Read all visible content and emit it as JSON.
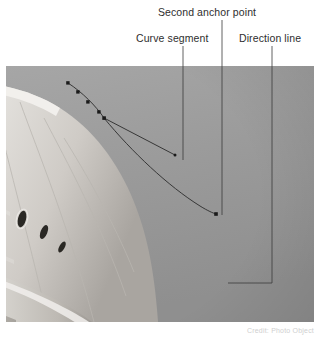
{
  "figure": {
    "kind": "annotated-photograph",
    "background_color": "#ffffff"
  },
  "callouts": [
    {
      "id": "second-anchor-point",
      "label": "Second anchor point",
      "leader_x": 222,
      "leader_y_start": 20,
      "leader_y_end": 215
    },
    {
      "id": "curve-segment",
      "label": "Curve segment",
      "leader_x": 183,
      "leader_y_start": 46,
      "leader_y_end": 160
    },
    {
      "id": "direction-line",
      "label": "Direction line",
      "leader_x": 272,
      "leader_y_start": 46,
      "leader_y_end": 283,
      "elbow_x": 228
    }
  ],
  "photo": {
    "subject": "United States Capitol dome",
    "style": "grayscale photograph",
    "sky_color": "#9b9b9b",
    "dome_color": "#e8e6e2",
    "x": 6,
    "y": 66,
    "width": 308,
    "height": 256
  },
  "path_overlay": {
    "stroke_color": "#2b2b2b",
    "anchor_fill": "#1a1a1a",
    "anchor_points": [
      {
        "x": 68,
        "y": 83
      },
      {
        "x": 78,
        "y": 92
      },
      {
        "x": 88,
        "y": 102
      },
      {
        "x": 99,
        "y": 112
      },
      {
        "x": 104,
        "y": 118
      },
      {
        "x": 216,
        "y": 214
      }
    ],
    "direction_line": {
      "from_x": 104,
      "from_y": 118,
      "to_x": 175,
      "to_y": 155
    }
  },
  "caption": {
    "text": "Credit: Photo Object"
  }
}
